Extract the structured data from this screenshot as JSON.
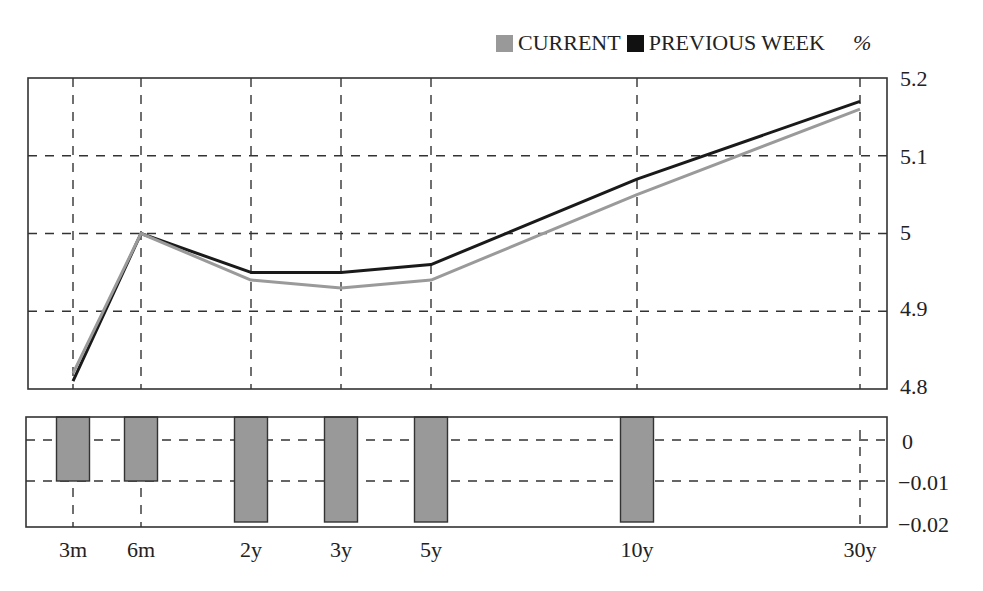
{
  "legend": {
    "items": [
      {
        "label": "CURRENT",
        "color": "#999999"
      },
      {
        "label": "PREVIOUS WEEK",
        "color": "#111111"
      }
    ],
    "unit": "%"
  },
  "colors": {
    "current": "#9a9a9a",
    "previous": "#1a1a1a",
    "bar_fill": "#999999",
    "grid": "#333333",
    "frame": "#333333"
  },
  "upper_axis": {
    "ticks": [
      "5.2",
      "5.1",
      "5",
      "4.9",
      "4.8"
    ]
  },
  "lower_axis": {
    "ticks": [
      "0",
      "−0.01",
      "−0.02"
    ]
  },
  "x_axis": {
    "ticks": [
      "3m",
      "6m",
      "2y",
      "3y",
      "5y",
      "10y",
      "30y"
    ]
  },
  "chart_data": [
    {
      "type": "line",
      "title": "",
      "xlabel": "",
      "ylabel": "%",
      "categories": [
        "3m",
        "6m",
        "2y",
        "3y",
        "5y",
        "10y",
        "30y"
      ],
      "series": [
        {
          "name": "CURRENT",
          "color": "#999999",
          "values": [
            4.82,
            5.0,
            4.94,
            4.93,
            4.94,
            5.05,
            5.16
          ]
        },
        {
          "name": "PREVIOUS WEEK",
          "color": "#111111",
          "values": [
            4.81,
            5.0,
            4.95,
            4.95,
            4.96,
            5.07,
            5.17
          ]
        }
      ],
      "ylim": [
        4.8,
        5.2
      ],
      "yticks": [
        4.8,
        4.9,
        5.0,
        5.1,
        5.2
      ],
      "grid": true,
      "legend_position": "top-right",
      "y_axis_side": "right"
    },
    {
      "type": "bar",
      "title": "",
      "xlabel": "",
      "ylabel": "",
      "categories": [
        "3m",
        "6m",
        "2y",
        "3y",
        "5y",
        "10y",
        "30y"
      ],
      "values": [
        -0.01,
        -0.01,
        -0.02,
        -0.02,
        -0.02,
        -0.02,
        0
      ],
      "ylim": [
        -0.02,
        0.005
      ],
      "yticks": [
        -0.02,
        -0.01,
        0
      ],
      "grid": true,
      "y_axis_side": "right"
    }
  ]
}
